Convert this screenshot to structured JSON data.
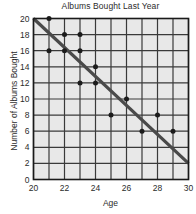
{
  "chart_data": {
    "type": "scatter",
    "title": "Albums Bought Last Year",
    "xlabel": "Age",
    "ylabel": "Number of Albums Bought",
    "xlim": [
      20,
      30
    ],
    "ylim": [
      0,
      20
    ],
    "xticks": [
      20,
      21,
      22,
      23,
      24,
      25,
      26,
      27,
      28,
      29,
      30
    ],
    "xtick_labels": [
      "20",
      "",
      "22",
      "",
      "24",
      "",
      "26",
      "",
      "28",
      "",
      "30"
    ],
    "yticks": [
      0,
      2,
      4,
      6,
      8,
      10,
      12,
      14,
      16,
      18,
      20
    ],
    "ytick_labels": [
      "0",
      "2",
      "4",
      "6",
      "8",
      "10",
      "12",
      "14",
      "16",
      "18",
      "20"
    ],
    "grid": true,
    "legend": "none",
    "points": [
      {
        "x": 21,
        "y": 20
      },
      {
        "x": 21,
        "y": 16
      },
      {
        "x": 22,
        "y": 18
      },
      {
        "x": 22,
        "y": 16
      },
      {
        "x": 23,
        "y": 18
      },
      {
        "x": 23,
        "y": 16
      },
      {
        "x": 23,
        "y": 12
      },
      {
        "x": 24,
        "y": 14
      },
      {
        "x": 24,
        "y": 12
      },
      {
        "x": 25,
        "y": 8
      },
      {
        "x": 26,
        "y": 10
      },
      {
        "x": 27,
        "y": 6
      },
      {
        "x": 28,
        "y": 8
      },
      {
        "x": 29,
        "y": 6
      }
    ],
    "trend_line": {
      "x0": 20,
      "y0": 20,
      "x1": 30,
      "y1": 2
    },
    "colors": {
      "plot_background": "#e8e8e8",
      "grid": "#3a3a3a",
      "axis": "#1a1a1a",
      "point": "#1c1c1c",
      "trend_line": "#4a4a4a",
      "text": "#2b2b2b",
      "page_background": "#ffffff"
    }
  }
}
